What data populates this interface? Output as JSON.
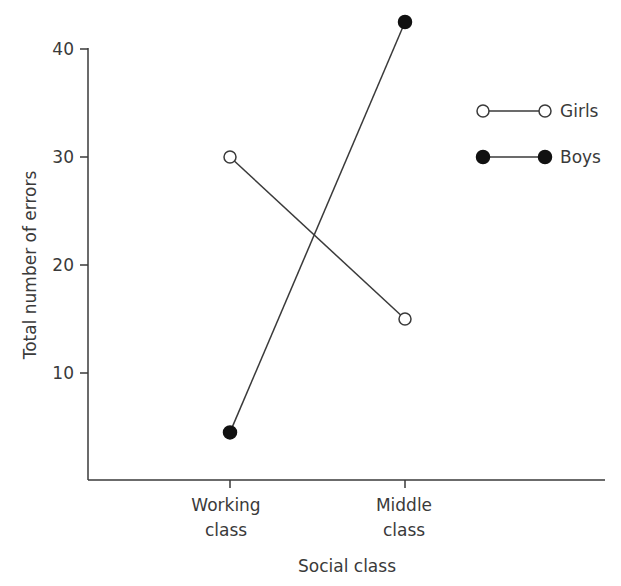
{
  "chart_data": {
    "type": "line",
    "title": "",
    "xlabel": "Social class",
    "ylabel": "Total number of errors",
    "categories": [
      "Working class",
      "Middle class"
    ],
    "category_lines": [
      [
        "Working",
        "class"
      ],
      [
        "Middle",
        "class"
      ]
    ],
    "yticks": [
      10,
      20,
      30,
      40
    ],
    "ylim": [
      0,
      44
    ],
    "grid": false,
    "legend_position": "upper right",
    "series": [
      {
        "name": "Girls",
        "marker": "open-circle",
        "values": [
          30,
          15
        ]
      },
      {
        "name": "Boys",
        "marker": "filled-circle",
        "values": [
          4.5,
          42.5
        ]
      }
    ]
  },
  "colors": {
    "line": "#3a3a3a",
    "marker_fill_open": "#ffffff",
    "marker_fill_filled": "#111111"
  }
}
